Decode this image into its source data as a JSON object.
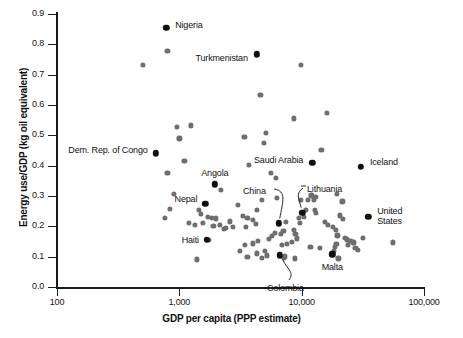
{
  "chart_data": {
    "type": "scatter",
    "title": "",
    "xlabel": "GDP per capita (PPP estimate)",
    "ylabel": "Energy use/GDP (kg oil equivalent)",
    "xscale": "log",
    "xlim": [
      100,
      100000
    ],
    "ylim": [
      0.0,
      0.9
    ],
    "grid": false,
    "legend": "none",
    "xticks": [
      "100",
      "1,000",
      "10,000",
      "100,000"
    ],
    "xtick_values": [
      100,
      1000,
      10000,
      100000
    ],
    "yticks": [
      "0.0",
      "0.1",
      "0.2",
      "0.3",
      "0.4",
      "0.5",
      "0.6",
      "0.7",
      "0.8",
      "0.9"
    ],
    "ytick_values": [
      0.0,
      0.1,
      0.2,
      0.3,
      0.4,
      0.5,
      0.6,
      0.7,
      0.8,
      0.9
    ],
    "marker_color_default": "#6e6e6e",
    "marker_color_highlight": "#101010",
    "annotations": [
      {
        "label": "Nigeria",
        "x": 780,
        "y": 0.855,
        "highlight": true,
        "anchor": "left",
        "label_dx": 9,
        "label_dy": -4,
        "leader": false
      },
      {
        "label": "Turkmenistan",
        "x": 4300,
        "y": 0.767,
        "highlight": true,
        "anchor": "right",
        "label_dx": -9,
        "label_dy": 4,
        "leader": false
      },
      {
        "label": "Dem. Rep. of Congo",
        "x": 640,
        "y": 0.441,
        "highlight": true,
        "anchor": "right",
        "label_dx": -8,
        "label_dy": -3,
        "leader": false
      },
      {
        "label": "Angola",
        "x": 1950,
        "y": 0.339,
        "highlight": true,
        "anchor": "center",
        "label_dx": 0,
        "label_dy": -11,
        "leader": false
      },
      {
        "label": "Nepal",
        "x": 1630,
        "y": 0.275,
        "highlight": true,
        "anchor": "right",
        "label_dx": -8,
        "label_dy": -5,
        "leader": false
      },
      {
        "label": "Haiti",
        "x": 1680,
        "y": 0.156,
        "highlight": true,
        "anchor": "right",
        "label_dx": -8,
        "label_dy": 0,
        "leader": false
      },
      {
        "label": "China",
        "x": 6500,
        "y": 0.21,
        "highlight": true,
        "anchor": "leader",
        "leader": true
      },
      {
        "label": "Colombia",
        "x": 6600,
        "y": 0.105,
        "highlight": true,
        "anchor": "leader",
        "leader": true
      },
      {
        "label": "Lithuania",
        "x": 10100,
        "y": 0.245,
        "highlight": true,
        "anchor": "leader",
        "leader": true
      },
      {
        "label": "Saudi Arabia",
        "x": 12200,
        "y": 0.41,
        "highlight": true,
        "anchor": "right",
        "label_dx": -9,
        "label_dy": -3,
        "leader": false
      },
      {
        "label": "Malta",
        "x": 17800,
        "y": 0.108,
        "highlight": true,
        "anchor": "center",
        "label_dx": 0,
        "label_dy": 13,
        "leader": false
      },
      {
        "label": "Iceland",
        "x": 30500,
        "y": 0.397,
        "highlight": true,
        "anchor": "left",
        "label_dx": 9,
        "label_dy": -6,
        "leader": false
      },
      {
        "label": "United States",
        "x": 35000,
        "y": 0.232,
        "highlight": true,
        "anchor": "left-two",
        "label_dx": 9,
        "label_dy": -7,
        "leader": false
      }
    ],
    "points": [
      {
        "x": 500,
        "y": 0.733
      },
      {
        "x": 800,
        "y": 0.778
      },
      {
        "x": 4600,
        "y": 0.633
      },
      {
        "x": 9800,
        "y": 0.733
      },
      {
        "x": 16200,
        "y": 0.573
      },
      {
        "x": 8700,
        "y": 0.556
      },
      {
        "x": 950,
        "y": 0.527
      },
      {
        "x": 1250,
        "y": 0.533
      },
      {
        "x": 5100,
        "y": 0.507
      },
      {
        "x": 3400,
        "y": 0.494
      },
      {
        "x": 1000,
        "y": 0.49
      },
      {
        "x": 4900,
        "y": 0.474
      },
      {
        "x": 14500,
        "y": 0.452
      },
      {
        "x": 1100,
        "y": 0.417
      },
      {
        "x": 3700,
        "y": 0.402
      },
      {
        "x": 800,
        "y": 0.375
      },
      {
        "x": 5600,
        "y": 0.377
      },
      {
        "x": 6200,
        "y": 0.36
      },
      {
        "x": 2200,
        "y": 0.321
      },
      {
        "x": 13100,
        "y": 0.297
      },
      {
        "x": 12000,
        "y": 0.302
      },
      {
        "x": 19500,
        "y": 0.307
      },
      {
        "x": 900,
        "y": 0.306
      },
      {
        "x": 4700,
        "y": 0.288
      },
      {
        "x": 6300,
        "y": 0.294
      },
      {
        "x": 11300,
        "y": 0.286
      },
      {
        "x": 12600,
        "y": 0.288
      },
      {
        "x": 21500,
        "y": 0.282
      },
      {
        "x": 3000,
        "y": 0.27
      },
      {
        "x": 840,
        "y": 0.258
      },
      {
        "x": 1450,
        "y": 0.255
      },
      {
        "x": 4300,
        "y": 0.253
      },
      {
        "x": 12900,
        "y": 0.253
      },
      {
        "x": 13000,
        "y": 0.243
      },
      {
        "x": 760,
        "y": 0.229
      },
      {
        "x": 3300,
        "y": 0.234
      },
      {
        "x": 3600,
        "y": 0.228
      },
      {
        "x": 1500,
        "y": 0.24
      },
      {
        "x": 1700,
        "y": 0.232
      },
      {
        "x": 1850,
        "y": 0.228
      },
      {
        "x": 2000,
        "y": 0.226
      },
      {
        "x": 4000,
        "y": 0.222
      },
      {
        "x": 10400,
        "y": 0.232
      },
      {
        "x": 20500,
        "y": 0.236
      },
      {
        "x": 21800,
        "y": 0.225
      },
      {
        "x": 1550,
        "y": 0.21
      },
      {
        "x": 1900,
        "y": 0.202
      },
      {
        "x": 2150,
        "y": 0.206
      },
      {
        "x": 2400,
        "y": 0.196
      },
      {
        "x": 1200,
        "y": 0.212
      },
      {
        "x": 1350,
        "y": 0.204
      },
      {
        "x": 3500,
        "y": 0.199
      },
      {
        "x": 4200,
        "y": 0.208
      },
      {
        "x": 2300,
        "y": 0.191
      },
      {
        "x": 7400,
        "y": 0.215
      },
      {
        "x": 9500,
        "y": 0.228
      },
      {
        "x": 9700,
        "y": 0.212
      },
      {
        "x": 18000,
        "y": 0.197
      },
      {
        "x": 19000,
        "y": 0.187
      },
      {
        "x": 19600,
        "y": 0.17
      },
      {
        "x": 22500,
        "y": 0.163
      },
      {
        "x": 23500,
        "y": 0.157
      },
      {
        "x": 25000,
        "y": 0.152
      },
      {
        "x": 24000,
        "y": 0.139
      },
      {
        "x": 26500,
        "y": 0.147
      },
      {
        "x": 27500,
        "y": 0.129
      },
      {
        "x": 29000,
        "y": 0.122
      },
      {
        "x": 19200,
        "y": 0.143
      },
      {
        "x": 18600,
        "y": 0.132
      },
      {
        "x": 18300,
        "y": 0.118
      },
      {
        "x": 20000,
        "y": 0.094
      },
      {
        "x": 56000,
        "y": 0.147
      },
      {
        "x": 31500,
        "y": 0.163
      },
      {
        "x": 7100,
        "y": 0.185
      },
      {
        "x": 6800,
        "y": 0.176
      },
      {
        "x": 6000,
        "y": 0.178
      },
      {
        "x": 5700,
        "y": 0.168
      },
      {
        "x": 5400,
        "y": 0.158
      },
      {
        "x": 8600,
        "y": 0.188
      },
      {
        "x": 8900,
        "y": 0.176
      },
      {
        "x": 9100,
        "y": 0.16
      },
      {
        "x": 8300,
        "y": 0.148
      },
      {
        "x": 7600,
        "y": 0.143
      },
      {
        "x": 6900,
        "y": 0.139
      },
      {
        "x": 11800,
        "y": 0.131
      },
      {
        "x": 14100,
        "y": 0.128
      },
      {
        "x": 4400,
        "y": 0.152
      },
      {
        "x": 4000,
        "y": 0.144
      },
      {
        "x": 3450,
        "y": 0.14
      },
      {
        "x": 3150,
        "y": 0.12
      },
      {
        "x": 3600,
        "y": 0.1
      },
      {
        "x": 4300,
        "y": 0.111
      },
      {
        "x": 4700,
        "y": 0.096
      },
      {
        "x": 5000,
        "y": 0.118
      },
      {
        "x": 5200,
        "y": 0.104
      },
      {
        "x": 7200,
        "y": 0.096
      },
      {
        "x": 7350,
        "y": 0.101
      },
      {
        "x": 8800,
        "y": 0.094
      },
      {
        "x": 1400,
        "y": 0.091
      },
      {
        "x": 2600,
        "y": 0.216
      },
      {
        "x": 2750,
        "y": 0.197
      },
      {
        "x": 1750,
        "y": 0.155
      },
      {
        "x": 9900,
        "y": 0.287
      },
      {
        "x": 10800,
        "y": 0.253
      },
      {
        "x": 15500,
        "y": 0.214
      },
      {
        "x": 16500,
        "y": 0.206
      }
    ]
  }
}
